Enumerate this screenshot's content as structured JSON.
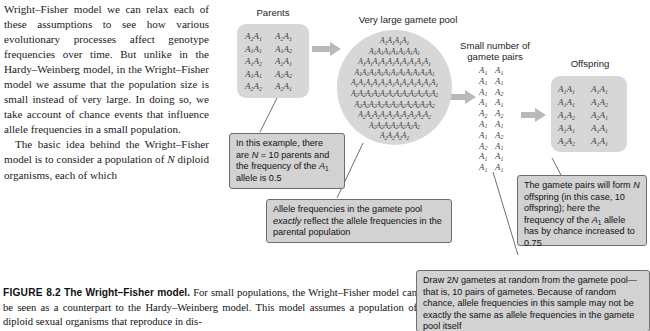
{
  "body_text": {
    "paragraph_1": "Wright–Fisher model we can relax each of these assumptions to see how various evolutionary processes affect genotype frequencies over time. But unlike in the Hardy–Weinberg model, in the Wright–Fisher model we assume that the population size is small instead of very large. In doing so, we take account of chance events that influence allele frequencies in a small population.",
    "paragraph_2_pre": "The basic idea behind the Wright–Fisher model is to consider a population of ",
    "paragraph_2_italic": "N",
    "paragraph_2_post": " diploid organisms, each of which"
  },
  "caption": {
    "figure_number": "FIGURE 8.2",
    "figure_title": "The Wright–Fisher model.",
    "text": " For small populations, the Wright–Fisher model can be seen as a counterpart to the Hardy–Weinberg model. This model assumes a population of diploid sexual organisms that reproduce in dis-"
  },
  "diagram": {
    "labels": {
      "parents": "Parents",
      "gamete_pool": "Very large gamete pool",
      "gamete_pairs_line1": "Small number of",
      "gamete_pairs_line2": "gamete pairs",
      "offspring": "Offspring"
    },
    "parents_genotypes": [
      [
        "A2A1",
        "A2A1"
      ],
      [
        "A1A1",
        "A1A2"
      ],
      [
        "A1A2",
        "A2A1"
      ],
      [
        "A1A1",
        "A2A2"
      ],
      [
        "A2A2",
        "A2A1"
      ]
    ],
    "gamete_pool_rows": [
      "A1A1A1A1",
      "A1A1A1A1A1A1A1",
      "A1A1A1A1A1A1A1A1A1A1",
      "A1A1A1A1A1A1A1A1A1A1A1",
      "A1A1A1A1A1A1A1A1A1A1A1A1",
      "A2A2A2A2A2A2A2A2A2A2A2A2",
      "A2A2A2A2A2A2A2A2A2A2A2",
      "A2A2A2A2A2A2A2A2A2A2",
      "A2A2A2A2A2A2A2",
      "A2A2A2A2"
    ],
    "gamete_pairs": [
      [
        "A1",
        "A1"
      ],
      [
        "A1",
        "A1"
      ],
      [
        "A1",
        "A2"
      ],
      [
        "A1",
        "A1"
      ],
      [
        "A2",
        "A2"
      ],
      [
        "A1",
        "A1"
      ],
      [
        "A1",
        "A2"
      ],
      [
        "A2",
        "A1"
      ],
      [
        "A1",
        "A1"
      ],
      [
        "A1",
        "A1"
      ]
    ],
    "offspring_genotypes": [
      [
        "A1A1",
        "A1A1"
      ],
      [
        "A1A1",
        "A1A2"
      ],
      [
        "A1A2",
        "A2A1"
      ],
      [
        "A1A1",
        "A1A1"
      ],
      [
        "A2A2",
        "A1A1"
      ]
    ],
    "callouts": {
      "parents_note": "In this example, there are N = 10 parents and the frequency of the A1 allele is 0.5",
      "pool_note": "Allele frequencies in the gamete pool exactly reflect the allele frequencies in the parental population",
      "offspring_note": "The gamete pairs will form N offspring (in this case, 10 offspring); here the frequency of the A1 allele has by chance increased to 0.75",
      "sampling_note": "Draw 2N gametes at random from the gamete pool—that is, 10 pairs of gametes. Because of random chance, allele frequencies in this sample may not be exactly the same as allele frequencies in the gamete pool itself"
    }
  },
  "colors": {
    "panel_grey": "#d7d7d7",
    "callout_grey": "#d2d2d2",
    "callout_border": "#6e6e6e",
    "arrow_grey": "#b9b9b9",
    "text_dark": "#1a1a1a"
  }
}
